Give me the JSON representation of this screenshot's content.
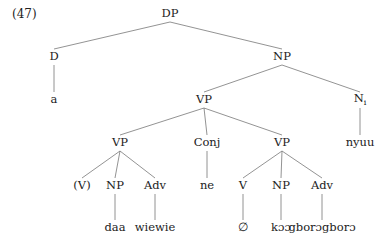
{
  "example_number": "(47)",
  "nodes": [
    {
      "id": "dp",
      "label": "DP",
      "x": 170,
      "y": 14
    },
    {
      "id": "d",
      "label": "D",
      "x": 54,
      "y": 57
    },
    {
      "id": "a",
      "label": "a",
      "x": 54,
      "y": 100
    },
    {
      "id": "np_top",
      "label": "NP",
      "x": 282,
      "y": 57
    },
    {
      "id": "vp_mid",
      "label": "VP",
      "x": 204,
      "y": 100
    },
    {
      "id": "n_i",
      "label": "N",
      "sub": "i",
      "x": 360,
      "y": 100
    },
    {
      "id": "nyuu",
      "label": "nyuu",
      "x": 360,
      "y": 143
    },
    {
      "id": "vp_left",
      "label": "VP",
      "x": 120,
      "y": 143
    },
    {
      "id": "conj",
      "label": "Conj",
      "x": 207,
      "y": 143
    },
    {
      "id": "vp_right",
      "label": "VP",
      "x": 282,
      "y": 143
    },
    {
      "id": "v_paren",
      "label": "(V)",
      "x": 82,
      "y": 186
    },
    {
      "id": "np_left",
      "label": "NP",
      "x": 115,
      "y": 186
    },
    {
      "id": "adv_left",
      "label": "Adv",
      "x": 155,
      "y": 186
    },
    {
      "id": "ne",
      "label": "ne",
      "x": 207,
      "y": 186
    },
    {
      "id": "v_right",
      "label": "V",
      "x": 243,
      "y": 186
    },
    {
      "id": "np_right",
      "label": "NP",
      "x": 281,
      "y": 186
    },
    {
      "id": "adv_right",
      "label": "Adv",
      "x": 322,
      "y": 186
    },
    {
      "id": "daa",
      "label": "daa",
      "x": 115,
      "y": 228
    },
    {
      "id": "wiewie",
      "label": "wiewie",
      "x": 155,
      "y": 228
    },
    {
      "id": "empty",
      "label": "∅",
      "x": 243,
      "y": 228
    },
    {
      "id": "koo",
      "label": "kɔɔ",
      "x": 281,
      "y": 228
    },
    {
      "id": "gborogboro",
      "label": "gborɔgborɔ",
      "x": 322,
      "y": 228
    }
  ],
  "edges": [
    [
      "dp",
      "d"
    ],
    [
      "dp",
      "np_top"
    ],
    [
      "d",
      "a"
    ],
    [
      "np_top",
      "vp_mid"
    ],
    [
      "np_top",
      "n_i"
    ],
    [
      "n_i",
      "nyuu"
    ],
    [
      "vp_mid",
      "vp_left"
    ],
    [
      "vp_mid",
      "conj"
    ],
    [
      "vp_mid",
      "vp_right"
    ],
    [
      "vp_left",
      "v_paren"
    ],
    [
      "vp_left",
      "np_left"
    ],
    [
      "vp_left",
      "adv_left"
    ],
    [
      "np_left",
      "daa"
    ],
    [
      "adv_left",
      "wiewie"
    ],
    [
      "conj",
      "ne"
    ],
    [
      "vp_right",
      "v_right"
    ],
    [
      "vp_right",
      "np_right"
    ],
    [
      "vp_right",
      "adv_right"
    ],
    [
      "v_right",
      "empty"
    ],
    [
      "np_right",
      "koo"
    ],
    [
      "adv_right",
      "gborogboro"
    ]
  ]
}
